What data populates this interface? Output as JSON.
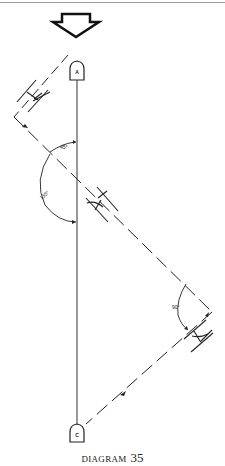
{
  "diagram": {
    "caption_word": "DIAGRAM",
    "caption_number": "35",
    "direction_arrow": "down",
    "marks": [
      {
        "label": "A",
        "position": "top"
      },
      {
        "label": "C",
        "position": "bottom"
      }
    ],
    "angles": [
      {
        "label": "45°"
      },
      {
        "label": "135°"
      },
      {
        "label": "90°"
      }
    ],
    "colors": {
      "ink": "#222222",
      "background": "#ffffff",
      "rule": "#9a9a9a"
    }
  }
}
